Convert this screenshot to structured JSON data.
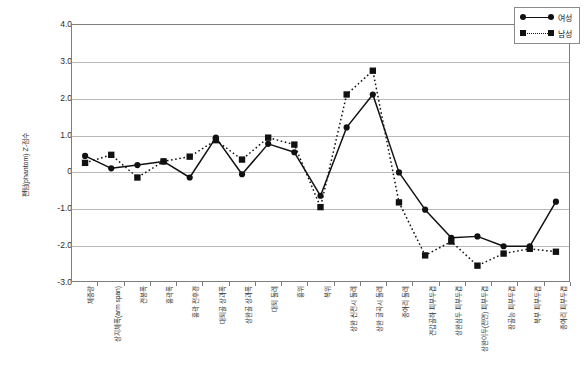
{
  "chart_data": {
    "type": "line",
    "title": "",
    "xlabel": "",
    "ylabel": "팬텀(phantom) Z-점수",
    "ylim": [
      -3.0,
      4.0
    ],
    "ytick_labels": [
      "4.0",
      "3.0",
      "2.0",
      "1.0",
      "0",
      "-1.0",
      "-2.0",
      "-3.0"
    ],
    "ytick_values": [
      4.0,
      3.0,
      2.0,
      1.0,
      0,
      -1.0,
      -2.0,
      -3.0
    ],
    "grid": true,
    "legend_position": "top-right",
    "categories": [
      "체중량",
      "상지체폭(arm span)",
      "견봉폭",
      "흉곽폭",
      "흉곽 전후경",
      "대퇴골 상과폭",
      "상완골 상과폭",
      "대퇴 둘레",
      "흉위",
      "복위",
      "상완 신전시 둘레",
      "상완 굴곡시 둘레",
      "종아리 둘레",
      "견갑골하 피부두겹",
      "상완삼두 피부두겹",
      "상완이두(전면) 피부두겹",
      "장골능 피부두겹",
      "복부 피부두겹",
      "종아리 피부두겹"
    ],
    "series": [
      {
        "name": "여성",
        "marker": "circle",
        "linestyle": "solid",
        "color": "#111111",
        "values": [
          0.42,
          0.08,
          0.17,
          0.27,
          -0.17,
          0.92,
          -0.08,
          0.75,
          0.52,
          -0.67,
          1.2,
          2.1,
          -0.03,
          -1.05,
          -1.82,
          -1.78,
          -2.05,
          -2.05,
          -0.83
        ]
      },
      {
        "name": "남성",
        "marker": "square",
        "linestyle": "dotted",
        "color": "#111111",
        "values": [
          0.23,
          0.45,
          -0.17,
          0.27,
          0.4,
          0.85,
          0.32,
          0.92,
          0.73,
          -0.98,
          2.1,
          2.75,
          -0.85,
          -2.3,
          -1.92,
          -2.58,
          -2.25,
          -2.12,
          -2.2
        ]
      }
    ]
  },
  "legend": {
    "entries": [
      {
        "label": "여성"
      },
      {
        "label": "남성"
      }
    ]
  }
}
